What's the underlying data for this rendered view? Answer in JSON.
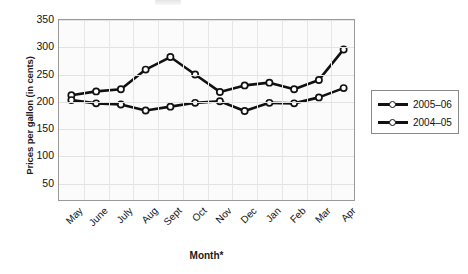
{
  "chart_data": {
    "type": "line",
    "title": "",
    "xlabel": "Month*",
    "ylabel": "Prices per gallon (in cents)",
    "categories": [
      "May",
      "June",
      "July",
      "Aug",
      "Sept",
      "Oct",
      "Nov",
      "Dec",
      "Jan",
      "Feb",
      "Mar",
      "Apr"
    ],
    "ylim": [
      16,
      350
    ],
    "yticks": [
      350,
      300,
      250,
      200,
      150,
      100,
      50
    ],
    "grid": true,
    "legend_position": "right-outside",
    "marker": "open-circle",
    "line_color": "#111111",
    "series": [
      {
        "name": "2005-06",
        "values": [
          212,
          219,
          223,
          259,
          282,
          250,
          218,
          230,
          235,
          223,
          240,
          296
        ]
      },
      {
        "name": "2004-05",
        "values": [
          203,
          197,
          195,
          184,
          191,
          198,
          201,
          183,
          198,
          197,
          208,
          225
        ]
      }
    ]
  },
  "axis": {
    "y_title": "Prices per gallon (in cents)",
    "x_title": "Month*"
  },
  "legend": {
    "entries": [
      {
        "label": "2005–06"
      },
      {
        "label": "2004–05"
      }
    ]
  }
}
